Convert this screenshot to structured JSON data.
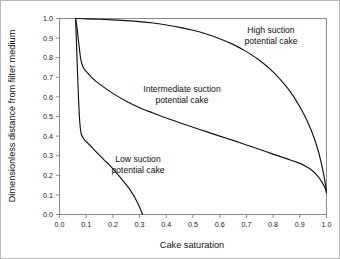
{
  "chart_data": {
    "type": "line",
    "title": "",
    "xlabel": "Cake saturation",
    "ylabel": "Dimensionless distance from filter medium",
    "xlim": [
      0.0,
      1.0
    ],
    "ylim": [
      0.0,
      1.0
    ],
    "grid": false,
    "legend": "none (inline annotations)",
    "xticks": [
      "0.0",
      "0.1",
      "0.2",
      "0.3",
      "0.4",
      "0.5",
      "0.6",
      "0.7",
      "0.8",
      "0.9",
      "1.0"
    ],
    "yticks": [
      "0.0",
      "0.1",
      "0.2",
      "0.3",
      "0.4",
      "0.5",
      "0.6",
      "0.7",
      "0.8",
      "0.9",
      "1.0"
    ],
    "xtick_values": [
      0.0,
      0.1,
      0.2,
      0.3,
      0.4,
      0.5,
      0.6,
      0.7,
      0.8,
      0.9,
      1.0
    ],
    "ytick_values": [
      0.0,
      0.1,
      0.2,
      0.3,
      0.4,
      0.5,
      0.6,
      0.7,
      0.8,
      0.9,
      1.0
    ],
    "series": [
      {
        "name": "High suction potential cake",
        "color": "#111111",
        "points": [
          [
            0.06,
            1.0
          ],
          [
            0.1,
            0.998
          ],
          [
            0.15,
            0.996
          ],
          [
            0.2,
            0.993
          ],
          [
            0.25,
            0.989
          ],
          [
            0.3,
            0.984
          ],
          [
            0.35,
            0.977
          ],
          [
            0.4,
            0.967
          ],
          [
            0.45,
            0.955
          ],
          [
            0.5,
            0.94
          ],
          [
            0.55,
            0.921
          ],
          [
            0.6,
            0.897
          ],
          [
            0.65,
            0.868
          ],
          [
            0.7,
            0.831
          ],
          [
            0.75,
            0.786
          ],
          [
            0.8,
            0.728
          ],
          [
            0.85,
            0.652
          ],
          [
            0.88,
            0.595
          ],
          [
            0.91,
            0.525
          ],
          [
            0.935,
            0.455
          ],
          [
            0.955,
            0.385
          ],
          [
            0.97,
            0.32
          ],
          [
            0.98,
            0.265
          ],
          [
            0.988,
            0.215
          ],
          [
            0.994,
            0.17
          ],
          [
            0.998,
            0.135
          ],
          [
            1.0,
            0.112
          ]
        ]
      },
      {
        "name": "Intermediate suction potential cake",
        "color": "#111111",
        "points": [
          [
            0.06,
            1.0
          ],
          [
            0.065,
            0.96
          ],
          [
            0.07,
            0.9
          ],
          [
            0.075,
            0.84
          ],
          [
            0.08,
            0.79
          ],
          [
            0.088,
            0.752
          ],
          [
            0.1,
            0.73
          ],
          [
            0.12,
            0.7
          ],
          [
            0.15,
            0.665
          ],
          [
            0.2,
            0.618
          ],
          [
            0.25,
            0.578
          ],
          [
            0.3,
            0.545
          ],
          [
            0.35,
            0.518
          ],
          [
            0.4,
            0.492
          ],
          [
            0.45,
            0.468
          ],
          [
            0.5,
            0.445
          ],
          [
            0.55,
            0.423
          ],
          [
            0.6,
            0.4
          ],
          [
            0.65,
            0.378
          ],
          [
            0.7,
            0.355
          ],
          [
            0.75,
            0.332
          ],
          [
            0.8,
            0.308
          ],
          [
            0.85,
            0.285
          ],
          [
            0.89,
            0.266
          ],
          [
            0.92,
            0.248
          ],
          [
            0.945,
            0.226
          ],
          [
            0.965,
            0.2
          ],
          [
            0.98,
            0.172
          ],
          [
            0.99,
            0.148
          ],
          [
            0.996,
            0.13
          ],
          [
            1.0,
            0.112
          ]
        ]
      },
      {
        "name": "Low suction potential cake",
        "color": "#111111",
        "points": [
          [
            0.06,
            1.0
          ],
          [
            0.063,
            0.9
          ],
          [
            0.066,
            0.78
          ],
          [
            0.069,
            0.67
          ],
          [
            0.072,
            0.57
          ],
          [
            0.075,
            0.49
          ],
          [
            0.078,
            0.44
          ],
          [
            0.082,
            0.408
          ],
          [
            0.09,
            0.388
          ],
          [
            0.1,
            0.372
          ],
          [
            0.115,
            0.352
          ],
          [
            0.13,
            0.33
          ],
          [
            0.15,
            0.302
          ],
          [
            0.17,
            0.275
          ],
          [
            0.19,
            0.248
          ],
          [
            0.21,
            0.218
          ],
          [
            0.23,
            0.186
          ],
          [
            0.25,
            0.152
          ],
          [
            0.268,
            0.118
          ],
          [
            0.284,
            0.082
          ],
          [
            0.297,
            0.046
          ],
          [
            0.306,
            0.018
          ],
          [
            0.311,
            0.0
          ]
        ]
      }
    ],
    "annotations": [
      {
        "name": "high-suction-label",
        "lines": [
          "High suction",
          "potential cake"
        ],
        "x_px": 270,
        "y_px": 32
      },
      {
        "name": "intermediate-suction-label",
        "lines": [
          "Intermediate suction",
          "potential cake"
        ],
        "x_px": 181,
        "y_px": 91
      },
      {
        "name": "low-suction-label",
        "lines": [
          "Low suction",
          "potential cake"
        ],
        "x_px": 137,
        "y_px": 161
      }
    ]
  }
}
